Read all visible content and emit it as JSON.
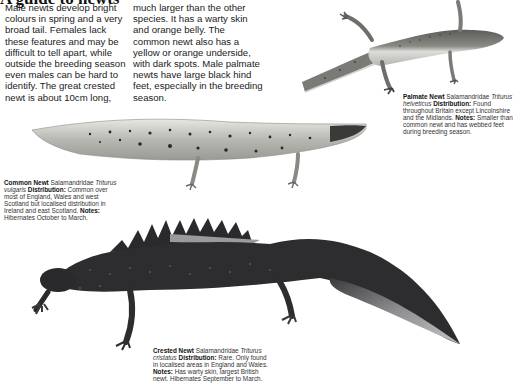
{
  "page": {
    "title": "A guide to newts",
    "intro_col1": "Male newts develop bright colours in spring and a very broad tail. Females lack these features and may be difficult to tell apart, while outside the breeding season even males can be hard to identify. The great crested newt is about 10cm long,",
    "intro_col2": "much larger than the other species. It has a warty skin and orange belly. The common newt also has a yellow or orange underside, with dark spots. Male palmate newts have large black hind feet, especially in the breeding season."
  },
  "species": [
    {
      "id": "palmate",
      "name": "Palmate Newt",
      "family": "Salamandridae",
      "latin": "Triturus helveticus",
      "distribution_label": "Distribution:",
      "distribution": "Found throughout Britain except Lincolnshire and the Midlands.",
      "notes_label": "Notes:",
      "notes": "Smaller than common newt and has webbed feet during breeding season."
    },
    {
      "id": "common",
      "name": "Common Newt",
      "family": "Salamandridae",
      "latin": "Triturus vulgaris",
      "distribution_label": "Distribution:",
      "distribution": "Common over most of England, Wales and west Scotland but localised distribution in Ireland and east Scotland.",
      "notes_label": "Notes:",
      "notes": "Hibernates October to March."
    },
    {
      "id": "crested",
      "name": "Crested Newt",
      "family": "Salamandridae",
      "latin": "Triturus cristatus",
      "distribution_label": "Distribution:",
      "distribution": "Rare. Only found in localised areas in England and Wales.",
      "notes_label": "Notes:",
      "notes": "Has warty skin, largest British newt. Hibernates September to March."
    }
  ],
  "colors": {
    "crested_body": "#2b2b2e",
    "crested_belly": "#bdbdbd",
    "common_body": "#cfcfca",
    "common_spots": "#2a2a2a",
    "palmate_back": "#6a6a66",
    "palmate_belly": "#d8d8d4"
  }
}
